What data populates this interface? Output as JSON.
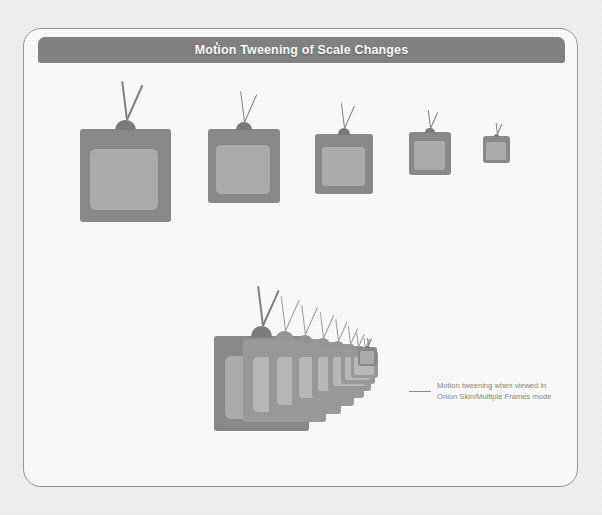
{
  "figure": {
    "title": "Motion Tweening of Scale Changes",
    "title_mark": "",
    "callout": {
      "line1": "Motion tweening when viewed in",
      "line2": "Onion Skin/Multiple Frames mode"
    }
  },
  "colors": {
    "page_background": "#f4f4f4",
    "card_background": "#ffffff",
    "card_border": "#9a9a9a",
    "title_bar": "#858585",
    "title_text": "#ffffff",
    "tv_body": "#8d8d8d",
    "tv_screen": "#b0b0b0",
    "tv_hub": "#7e7e7e",
    "tv_antenna": "#838383",
    "ghost_body": "#9e9e9e",
    "ghost_screen": "#bdbdbd",
    "callout_text": "#8b8b8b",
    "callout_line": "#8f8f8f"
  },
  "chart_data": {
    "type": "diagram",
    "title": "Motion Tweening of Scale Changes",
    "rows": [
      {
        "name": "keyframe-sequence",
        "label": "Scale tween keyframes (left to right, decreasing scale)",
        "frames": [
          {
            "index": 1,
            "x": 79,
            "y": 128,
            "width": 91,
            "height": 93,
            "scale": 1.0
          },
          {
            "index": 2,
            "x": 207,
            "y": 128,
            "width": 72,
            "height": 74,
            "scale": 0.79
          },
          {
            "index": 3,
            "x": 314,
            "y": 133,
            "width": 58,
            "height": 60,
            "scale": 0.64
          },
          {
            "index": 4,
            "x": 408,
            "y": 131,
            "width": 42,
            "height": 43,
            "scale": 0.46
          },
          {
            "index": 5,
            "x": 482,
            "y": 135,
            "width": 27,
            "height": 27,
            "scale": 0.29
          }
        ]
      },
      {
        "name": "onion-skin-sequence",
        "label": "Onion Skin / Multiple Frames preview",
        "frames": [
          {
            "index": 1,
            "x": 213,
            "y": 335,
            "width": 95,
            "height": 95,
            "scale": 1.0,
            "ghost": false
          },
          {
            "index": 2,
            "x": 242,
            "y": 338,
            "width": 83,
            "height": 83,
            "scale": 0.87,
            "ghost": true
          },
          {
            "index": 3,
            "x": 268,
            "y": 341,
            "width": 72,
            "height": 72,
            "scale": 0.76,
            "ghost": true
          },
          {
            "index": 4,
            "x": 291,
            "y": 343,
            "width": 62,
            "height": 62,
            "scale": 0.65,
            "ghost": true
          },
          {
            "index": 5,
            "x": 311,
            "y": 345,
            "width": 52,
            "height": 52,
            "scale": 0.55,
            "ghost": true
          },
          {
            "index": 6,
            "x": 327,
            "y": 347,
            "width": 43,
            "height": 43,
            "scale": 0.45,
            "ghost": true
          },
          {
            "index": 7,
            "x": 340,
            "y": 349,
            "width": 34,
            "height": 34,
            "scale": 0.36,
            "ghost": true
          },
          {
            "index": 8,
            "x": 350,
            "y": 350,
            "width": 27,
            "height": 27,
            "scale": 0.28,
            "ghost": true
          },
          {
            "index": 9,
            "x": 357,
            "y": 346,
            "width": 19,
            "height": 19,
            "scale": 0.2,
            "ghost": false
          }
        ]
      }
    ]
  }
}
